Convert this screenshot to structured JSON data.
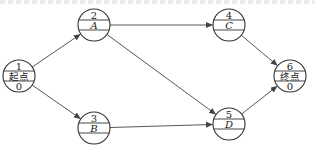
{
  "diagram": {
    "type": "activity-on-node network",
    "nodes": [
      {
        "id": "1",
        "top": "1",
        "middle": "起点",
        "bottom": "0",
        "cx": 19,
        "cy": 76
      },
      {
        "id": "2",
        "top": "2",
        "middle": "A",
        "bottom": "",
        "cx": 94,
        "cy": 25
      },
      {
        "id": "3",
        "top": "3",
        "middle": "B",
        "bottom": "",
        "cx": 94,
        "cy": 128
      },
      {
        "id": "4",
        "top": "4",
        "middle": "C",
        "bottom": "",
        "cx": 229,
        "cy": 25
      },
      {
        "id": "5",
        "top": "5",
        "middle": "D",
        "bottom": "",
        "cx": 229,
        "cy": 124
      },
      {
        "id": "6",
        "top": "6",
        "middle": "终点",
        "bottom": "0",
        "cx": 290,
        "cy": 76
      }
    ],
    "edges": [
      {
        "from": "1",
        "to": "2"
      },
      {
        "from": "1",
        "to": "3"
      },
      {
        "from": "2",
        "to": "4"
      },
      {
        "from": "2",
        "to": "5"
      },
      {
        "from": "3",
        "to": "5"
      },
      {
        "from": "4",
        "to": "6"
      },
      {
        "from": "5",
        "to": "6"
      }
    ],
    "node_radius": 16,
    "stroke_color": "#333333"
  }
}
